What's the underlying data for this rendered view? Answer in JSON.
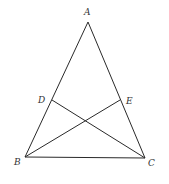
{
  "diagram": {
    "type": "geometry-triangle",
    "stroke_color": "#2a2a2a",
    "points": {
      "A": {
        "label": "A",
        "x": 88,
        "y": 22,
        "lx": 84,
        "ly": 15
      },
      "B": {
        "label": "B",
        "x": 25,
        "y": 157,
        "lx": 14,
        "ly": 165
      },
      "C": {
        "label": "C",
        "x": 145,
        "y": 158,
        "lx": 148,
        "ly": 166
      },
      "D": {
        "label": "D",
        "x": 52,
        "y": 100,
        "lx": 38,
        "ly": 103
      },
      "E": {
        "label": "E",
        "x": 120,
        "y": 100,
        "lx": 126,
        "ly": 104
      }
    },
    "segments": [
      [
        "A",
        "B"
      ],
      [
        "A",
        "C"
      ],
      [
        "B",
        "C"
      ],
      [
        "B",
        "E"
      ],
      [
        "C",
        "D"
      ]
    ]
  }
}
